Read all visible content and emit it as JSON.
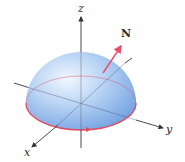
{
  "diagram": {
    "type": "hemisphere-surface",
    "axes": {
      "x_label": "x",
      "y_label": "y",
      "z_label": "z"
    },
    "normal_vector_label": "N",
    "colors": {
      "surface_light": "#e8f1fc",
      "surface_mid": "#a9c9f0",
      "surface_dark": "#6d9fe0",
      "boundary": "#e0485e",
      "normal_arrow": "#e8506a",
      "axis": "#333333"
    }
  }
}
